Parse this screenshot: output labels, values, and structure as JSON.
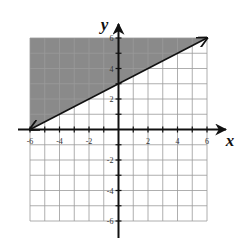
{
  "chart_data": {
    "type": "line",
    "title": "",
    "xlabel": "x",
    "ylabel": "y",
    "xlim": [
      -6,
      6
    ],
    "ylim": [
      -6,
      6
    ],
    "grid": true,
    "x_tick_labels": [
      "-6",
      "-4",
      "-2",
      "2",
      "4",
      "6"
    ],
    "y_tick_labels": [
      "6",
      "4",
      "2",
      "-2",
      "-4",
      "-6"
    ],
    "series": [
      {
        "name": "boundary line",
        "style": "solid",
        "arrows": "both ends",
        "x": [
          -6,
          0,
          6
        ],
        "y": [
          0,
          3,
          6
        ],
        "equation": "y = 0.5x + 3"
      }
    ],
    "shaded_region": {
      "side": "above",
      "inequality": "y >= 0.5x + 3",
      "vertices": [
        [
          -6,
          0
        ],
        [
          6,
          6
        ],
        [
          -6,
          6
        ]
      ]
    },
    "colors": {
      "shade": "#8a8a8a",
      "grid": "#9a9a9a",
      "axis": "#111111",
      "line": "#111111"
    }
  }
}
